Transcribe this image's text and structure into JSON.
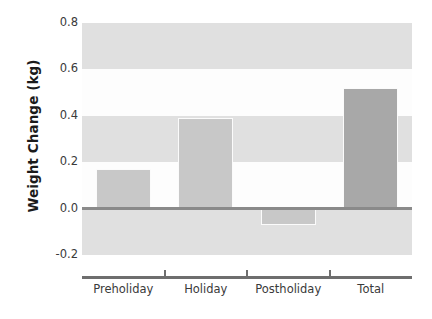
{
  "chart_data": {
    "type": "bar",
    "title": "",
    "xlabel": "",
    "ylabel": "Weight Change (kg)",
    "categories": [
      "Preholiday",
      "Holiday",
      "Postholiday",
      "Total"
    ],
    "values": [
      0.17,
      0.39,
      -0.07,
      0.52
    ],
    "series": [
      {
        "name": "Weight Change",
        "values": [
          0.17,
          0.39,
          -0.07,
          0.52
        ]
      }
    ],
    "ylim": [
      -0.2,
      0.8
    ],
    "ytick_labels": [
      "0.8",
      "0.6",
      "0.4",
      "0.2",
      "0.0",
      "-0.2"
    ],
    "ytick_values": [
      0.8,
      0.6,
      0.4,
      0.2,
      0.0,
      -0.2
    ],
    "grid": "alternating-horizontal-bands",
    "legend": "none",
    "zero_line": 0.0,
    "bar_colors": [
      "#c8c8c8",
      "#c8c8c8",
      "#c8c8c8",
      "#a8a8a8"
    ],
    "band_color": "#e0e0e0",
    "background_color": "#fdfdfd",
    "zero_line_color": "#8a8a8a",
    "axis_color": "#6e6e6e"
  }
}
